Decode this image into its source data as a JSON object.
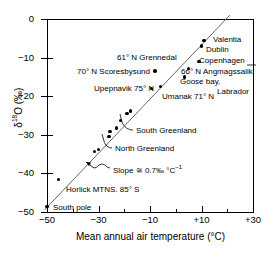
{
  "chart_data": {
    "type": "scatter",
    "title": "",
    "xlabel": "Mean annual air temperature (°C)",
    "ylabel": "δ¹⁸O (‰)",
    "xlim": [
      -50,
      30
    ],
    "ylim": [
      -50,
      0
    ],
    "xticks": [
      -50,
      -30,
      -10,
      10,
      30
    ],
    "xtick_labels": [
      "−50",
      "−30",
      "−10",
      "+10",
      "+30"
    ],
    "yticks": [
      0,
      -10,
      -20,
      -30,
      -40,
      -50
    ],
    "ytick_labels": [
      "0",
      "−10",
      "−20",
      "−30",
      "−40",
      "−50"
    ],
    "grid": false,
    "legend": "none",
    "points": [
      {
        "name": "South pole",
        "x": -50.0,
        "y": -48.5
      },
      {
        "name": "Horlick MTNS. 85° S",
        "x": -45.5,
        "y": -41.5
      },
      {
        "name": "north-greenland-1",
        "x": -31.5,
        "y": -34.3
      },
      {
        "name": "north-greenland-2",
        "x": -30.0,
        "y": -33.8
      },
      {
        "name": "north-greenland-3",
        "x": -26.0,
        "y": -30.5
      },
      {
        "name": "north-greenland-4",
        "x": -25.5,
        "y": -29.2
      },
      {
        "name": "south-greenland-1",
        "x": -23.0,
        "y": -28.2
      },
      {
        "name": "south-greenland-2",
        "x": -21.5,
        "y": -26.3
      },
      {
        "name": "south-greenland-3",
        "x": -19.0,
        "y": -24.5
      },
      {
        "name": "south-greenland-4",
        "x": -17.5,
        "y": -23.8
      },
      {
        "name": "Upepnavik 75° N",
        "x": -9.5,
        "y": -18.0
      },
      {
        "name": "70° N Scoresbysund",
        "x": -8.0,
        "y": -13.5
      },
      {
        "name": "Umanak 71° N",
        "x": -6.0,
        "y": -17.5
      },
      {
        "name": "Goose bay, Labrador",
        "x": 3.5,
        "y": -15.0
      },
      {
        "name": "66° N Angmagssalik",
        "x": 5.0,
        "y": -12.8
      },
      {
        "name": "Copenhagen",
        "x": 9.0,
        "y": -11.0
      },
      {
        "name": "Dublin",
        "x": 10.0,
        "y": -7.0
      },
      {
        "name": "Valentia",
        "x": 11.0,
        "y": -5.5
      }
    ],
    "fit_line": {
      "label": "Slope ≅ 0.7‰ °C⁻¹",
      "x0": -51.0,
      "y0": -49.5,
      "x1": 21.0,
      "y1": 1.0
    },
    "annotations": [
      {
        "id": "grennedal",
        "text": "61° N Grennedal"
      },
      {
        "id": "scoresbysund",
        "text": "70° N Scoresbysund"
      },
      {
        "id": "upepnavik",
        "text": "Upepnavik 75° N"
      },
      {
        "id": "umanak",
        "text": "Umanak 71° N"
      },
      {
        "id": "valentia",
        "text": "Valentia"
      },
      {
        "id": "dublin",
        "text": "Dublin"
      },
      {
        "id": "copenhagen",
        "text": "Copenhagen"
      },
      {
        "id": "angmagssalik",
        "text": "66° N Angmagssalik"
      },
      {
        "id": "goose_bay",
        "text": "Goose bay,"
      },
      {
        "id": "labrador",
        "text": "Labrador"
      },
      {
        "id": "south_greenland",
        "text": "South Greenland"
      },
      {
        "id": "north_greenland",
        "text": "North Greenland"
      },
      {
        "id": "slope",
        "text": "Slope ≅ 0.7‰ °C⁻¹"
      },
      {
        "id": "horlick",
        "text": "Horlick MTNS. 85° S"
      },
      {
        "id": "south_pole",
        "text": "South pole"
      }
    ]
  },
  "axes": {
    "x_title": "Mean annual air temperature (°C)",
    "y_title_pre": "δ",
    "y_title_sup": "18",
    "y_title_post": "O (‰)",
    "x_labels": [
      "−50",
      "−30",
      "−10",
      "+10",
      "+30"
    ],
    "y_labels": [
      "0",
      "−10",
      "−20",
      "−30",
      "−40",
      "−50"
    ]
  },
  "labels": {
    "grennedal": "61° N Grennedal",
    "scoresbysund": "70° N Scoresbysund",
    "upepnavik": "Upepnavik 75° N",
    "umanak": "Umanak 71° N",
    "valentia": "Valentia",
    "dublin": "Dublin",
    "copenhagen": "Copenhagen",
    "angmagssalik": "66° N Angmagssalik",
    "goose_bay": "Goose bay,",
    "labrador": "Labrador",
    "south_greenland": "South Greenland",
    "north_greenland": "North Greenland",
    "slope_pre": "Slope ≅ 0.7‰ °C",
    "slope_sup": "−1",
    "horlick": "Horlick MTNS. 85° S",
    "south_pole": "South pole"
  },
  "colors": {
    "axis": "#000000",
    "point": "#000000",
    "line": "#555555",
    "background": "#ffffff"
  }
}
